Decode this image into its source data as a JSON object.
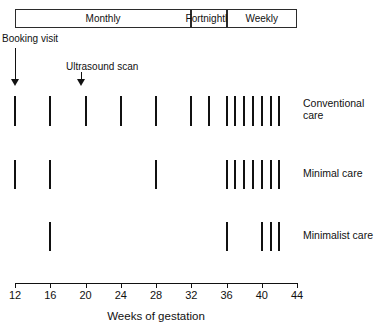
{
  "chart_data": {
    "type": "timeline",
    "title": "",
    "xlabel": "Weeks of gestation",
    "ylabel": "",
    "xlim": [
      12,
      44
    ],
    "xticks": [
      12,
      16,
      20,
      24,
      28,
      32,
      36,
      40,
      44
    ],
    "xtick_labels": [
      "12",
      "16",
      "20",
      "24",
      "28",
      "32",
      "36",
      "40",
      "44"
    ],
    "grid": false,
    "legend": "none",
    "schedule_bands": [
      {
        "label": "Monthly",
        "start": 12,
        "end": 32
      },
      {
        "label": "Fortnightly",
        "start": 32,
        "end": 36
      },
      {
        "label": "Weekly",
        "start": 36,
        "end": 44
      }
    ],
    "annotations": [
      {
        "label": "Booking visit",
        "week": 12
      },
      {
        "label": "Ultrasound scan",
        "week": 19.5
      }
    ],
    "series": [
      {
        "name": "Conventional care",
        "label": "Conventional\ncare",
        "visit_weeks": [
          12,
          16,
          20,
          24,
          28,
          32,
          34,
          36,
          37,
          38,
          39,
          40,
          41,
          42
        ],
        "visit_count": 14
      },
      {
        "name": "Minimal care",
        "label": "Minimal care",
        "visit_weeks": [
          12,
          16,
          28,
          36,
          37,
          38,
          39,
          40,
          41,
          42
        ],
        "visit_count": 10
      },
      {
        "name": "Minimalist care",
        "label": "Minimalist care",
        "visit_weeks": [
          16,
          36,
          40,
          41,
          42
        ],
        "visit_count": 5
      }
    ]
  },
  "colors": {
    "ink": "#111111",
    "band_border": "#2b2b2b",
    "background": "#ffffff"
  },
  "layout": {
    "x_axis_left_px": 15,
    "x_axis_right_px": 297,
    "row_y_px": [
      96,
      160,
      222
    ],
    "row_height_px": [
      30,
      29,
      29
    ],
    "label_x_px": 303
  }
}
